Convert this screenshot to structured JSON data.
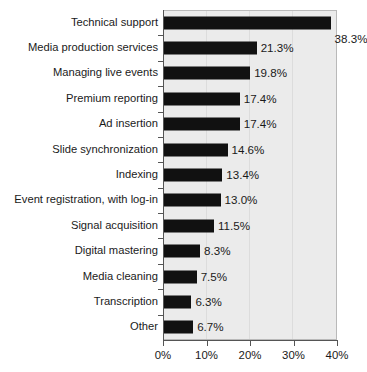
{
  "chart_data": {
    "type": "bar",
    "orientation": "horizontal",
    "title": "",
    "subtitle": "",
    "xlabel": "",
    "ylabel": "",
    "xlim": [
      0,
      40
    ],
    "xticks": [
      0,
      10,
      20,
      30,
      40
    ],
    "xtick_labels": [
      "0%",
      "10%",
      "20%",
      "30%",
      "40%"
    ],
    "grid": true,
    "legend": false,
    "categories": [
      "Technical support",
      "Media production services",
      "Managing live events",
      "Premium reporting",
      "Ad insertion",
      "Slide synchronization",
      "Indexing",
      "Event registration, with log-in",
      "Signal acquisition",
      "Digital mastering",
      "Media cleaning",
      "Transcription",
      "Other"
    ],
    "values": [
      38.3,
      21.3,
      19.8,
      17.4,
      17.4,
      14.6,
      13.4,
      13.0,
      11.5,
      8.3,
      7.5,
      6.3,
      6.7
    ],
    "data_labels": [
      "38.3%",
      "21.3%",
      "19.8%",
      "17.4%",
      "17.4%",
      "14.6%",
      "13.4%",
      "13.0%",
      "11.5%",
      "8.3%",
      "7.5%",
      "6.3%",
      "6.7%"
    ],
    "colors": {
      "bar": "#111111",
      "plot_background": "#ebebeb",
      "figure_background": "#ffffff",
      "axis": "#555555",
      "gridline": "#dcdcdc",
      "text": "#1a1a1a"
    }
  }
}
